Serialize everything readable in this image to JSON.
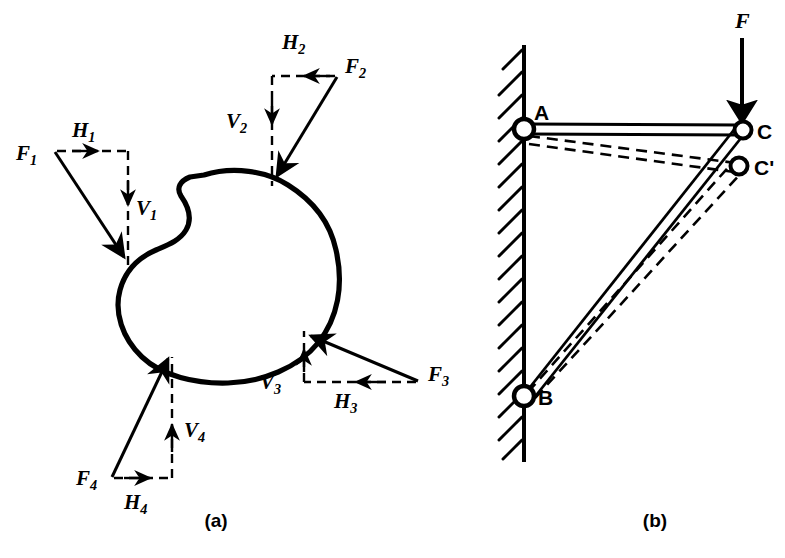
{
  "figure": {
    "background_color": "#ffffff",
    "ink_color": "#000000",
    "captions": [
      {
        "id": "caption-a",
        "text": "(a)",
        "x": 216,
        "y": 523
      },
      {
        "id": "caption-b",
        "text": "(b)",
        "x": 655,
        "y": 523
      }
    ]
  },
  "panel_a": {
    "name": "free-body-diagram",
    "body_label": "irregular rigid body outline",
    "forces": [
      {
        "id": "force-1",
        "force_label": "F",
        "force_sub": "1",
        "horizontal_label": "H",
        "horizontal_sub": "1",
        "vertical_label": "V",
        "vertical_sub": "1",
        "tail": {
          "x": 55,
          "y": 152
        },
        "head": {
          "x": 128,
          "y": 262
        },
        "corner": {
          "x": 128,
          "y": 152
        },
        "direction": "down-right",
        "force_text_pos": {
          "x": 22,
          "y": 157
        },
        "h_text_pos": {
          "x": 78,
          "y": 134
        },
        "v_text_pos": {
          "x": 137,
          "y": 208
        }
      },
      {
        "id": "force-2",
        "force_label": "F",
        "force_sub": "2",
        "horizontal_label": "H",
        "horizontal_sub": "2",
        "vertical_label": "V",
        "vertical_sub": "2",
        "tail": {
          "x": 337,
          "y": 77
        },
        "head": {
          "x": 272,
          "y": 182
        },
        "corner": {
          "x": 272,
          "y": 77
        },
        "direction": "down-left",
        "force_text_pos": {
          "x": 345,
          "y": 70
        },
        "h_text_pos": {
          "x": 287,
          "y": 46
        },
        "v_text_pos": {
          "x": 232,
          "y": 123
        }
      },
      {
        "id": "force-3",
        "force_label": "F",
        "force_sub": "3",
        "horizontal_label": "H",
        "horizontal_sub": "3",
        "vertical_label": "V",
        "vertical_sub": "3",
        "tail": {
          "x": 418,
          "y": 381
        },
        "head": {
          "x": 304,
          "y": 333
        },
        "corner": {
          "x": 304,
          "y": 381
        },
        "direction": "up-left",
        "force_text_pos": {
          "x": 430,
          "y": 376
        },
        "h_text_pos": {
          "x": 340,
          "y": 402
        },
        "v_text_pos": {
          "x": 267,
          "y": 378
        }
      },
      {
        "id": "force-4",
        "force_label": "F",
        "force_sub": "4",
        "horizontal_label": "H",
        "horizontal_sub": "4",
        "vertical_label": "V",
        "vertical_sub": "4",
        "tail": {
          "x": 112,
          "y": 477
        },
        "head": {
          "x": 172,
          "y": 352
        },
        "corner": {
          "x": 172,
          "y": 477
        },
        "direction": "up-right",
        "force_text_pos": {
          "x": 82,
          "y": 478
        },
        "h_text_pos": {
          "x": 130,
          "y": 501
        },
        "v_text_pos": {
          "x": 190,
          "y": 429
        }
      }
    ]
  },
  "panel_b": {
    "name": "two-bar-linkage-diagram",
    "wall": {
      "x": 524,
      "y_top": 45,
      "y_bottom": 462,
      "hatch_label": "fixed-support-hatching"
    },
    "applied_force": {
      "id": "applied-force-F",
      "label": "F",
      "label_pos": {
        "x": 744,
        "y": 24
      },
      "tail": {
        "x": 742,
        "y": 38
      },
      "head": {
        "x": 742,
        "y": 128
      },
      "direction": "downward"
    },
    "joints": [
      {
        "id": "joint-A",
        "label": "A",
        "x": 524,
        "y": 129,
        "label_pos": {
          "x": 538,
          "y": 113
        },
        "state": "undeflected"
      },
      {
        "id": "joint-B",
        "label": "B",
        "x": 524,
        "y": 396,
        "label_pos": {
          "x": 540,
          "y": 403
        },
        "state": "undeflected"
      },
      {
        "id": "joint-C",
        "label": "C",
        "x": 743,
        "y": 130,
        "label_pos": {
          "x": 757,
          "y": 137
        },
        "state": "undeflected"
      },
      {
        "id": "joint-Cp",
        "label": "C'",
        "x": 739,
        "y": 166,
        "label_pos": {
          "x": 755,
          "y": 173
        },
        "state": "deflected"
      }
    ],
    "members": [
      {
        "id": "member-AC",
        "from": "A",
        "to": "C",
        "style": "solid",
        "state": "undeflected"
      },
      {
        "id": "member-BC",
        "from": "B",
        "to": "C",
        "style": "solid",
        "state": "undeflected"
      },
      {
        "id": "member-ACp",
        "from": "A",
        "to": "C'",
        "style": "dashed",
        "state": "deflected"
      },
      {
        "id": "member-BCp",
        "from": "B",
        "to": "C'",
        "style": "dashed",
        "state": "deflected"
      }
    ]
  }
}
